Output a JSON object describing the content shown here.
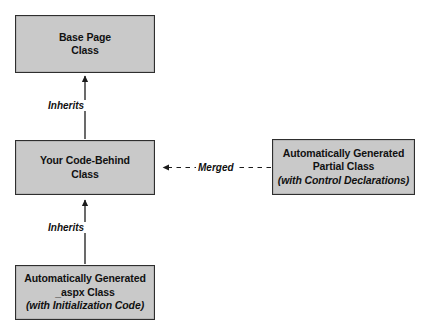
{
  "diagram": {
    "background_color": "#ffffff",
    "node_fill_color": "#c9c9c9",
    "node_border_color": "#2e2e2e",
    "text_color": "#111111",
    "nodes": [
      {
        "id": "base-page",
        "line1": "Base Page",
        "line2": "Class",
        "line3": ""
      },
      {
        "id": "code-behind",
        "line1": "Your Code-Behind",
        "line2": "Class",
        "line3": ""
      },
      {
        "id": "aspx",
        "line1": "Automatically Generated",
        "line2": "_aspx Class",
        "line3": "(with Initialization Code)"
      },
      {
        "id": "partial",
        "line1": "Automatically Generated",
        "line2": "Partial Class",
        "line3": "(with Control Declarations)"
      }
    ],
    "edges": [
      {
        "id": "inherits-top",
        "label": "Inherits",
        "style": "solid",
        "from": "code-behind",
        "to": "base-page"
      },
      {
        "id": "inherits-bottom",
        "label": "Inherits",
        "style": "solid",
        "from": "aspx",
        "to": "code-behind"
      },
      {
        "id": "merged",
        "label": "Merged",
        "style": "dashed",
        "from": "partial",
        "to": "code-behind"
      }
    ]
  }
}
